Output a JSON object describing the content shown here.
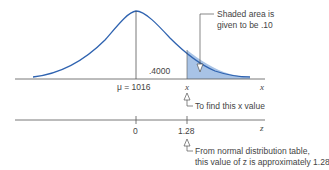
{
  "diagram": {
    "colors": {
      "curve": "#2f63b0",
      "shade": "#a8c3e6",
      "axis": "#555555",
      "text": "#444444"
    },
    "top_axis": {
      "mean_label": "μ = 1016",
      "x_marker_label": "x",
      "axis_label": "x",
      "area_label": ".4000"
    },
    "callouts": {
      "shaded_area_line1": "Shaded area is",
      "shaded_area_line2": "given to be .10",
      "find_x": "To find this x value",
      "z_table_line1": "From normal distribution table,",
      "z_table_line2": "this value of z is approximately 1.28"
    },
    "bottom_axis": {
      "tick_zero": "0",
      "tick_z": "1.28",
      "axis_label": "z"
    }
  }
}
